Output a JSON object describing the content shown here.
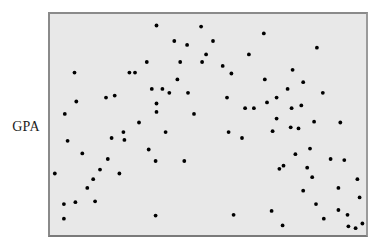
{
  "chart_data": {
    "type": "scatter",
    "title": "",
    "xlabel": "",
    "ylabel": "GPA",
    "xlim": [
      0,
      100
    ],
    "ylim": [
      0,
      100
    ],
    "grid": false,
    "legend": null,
    "x_ticks": [],
    "y_ticks": [],
    "background_color": "#e8e8e8",
    "frame_color": "#8a8a8a",
    "point_color": "#000000",
    "note": "No axis ticks or numeric scale visible; coordinates are relative positions (0-100) within the plot frame. Points form an inverted-U pattern.",
    "series": [
      {
        "name": "students",
        "points": [
          {
            "x": 0.9,
            "y": 27.4
          },
          {
            "x": 3.8,
            "y": 13.3
          },
          {
            "x": 3.8,
            "y": 6.6
          },
          {
            "x": 4.1,
            "y": 54.9
          },
          {
            "x": 5.0,
            "y": 42.5
          },
          {
            "x": 7.2,
            "y": 73.9
          },
          {
            "x": 7.5,
            "y": 14.2
          },
          {
            "x": 7.8,
            "y": 60.6
          },
          {
            "x": 9.7,
            "y": 36.7
          },
          {
            "x": 11.3,
            "y": 20.8
          },
          {
            "x": 13.2,
            "y": 24.8
          },
          {
            "x": 13.8,
            "y": 14.6
          },
          {
            "x": 15.4,
            "y": 29.2
          },
          {
            "x": 17.3,
            "y": 62.4
          },
          {
            "x": 17.9,
            "y": 34.1
          },
          {
            "x": 19.1,
            "y": 43.8
          },
          {
            "x": 20.1,
            "y": 63.3
          },
          {
            "x": 21.6,
            "y": 27.4
          },
          {
            "x": 22.9,
            "y": 46.5
          },
          {
            "x": 23.2,
            "y": 42.9
          },
          {
            "x": 24.8,
            "y": 73.9
          },
          {
            "x": 26.6,
            "y": 73.9
          },
          {
            "x": 27.9,
            "y": 50.9
          },
          {
            "x": 30.4,
            "y": 78.8
          },
          {
            "x": 31.0,
            "y": 38.5
          },
          {
            "x": 32.0,
            "y": 66.4
          },
          {
            "x": 33.5,
            "y": 55.8
          },
          {
            "x": 33.5,
            "y": 59.7
          },
          {
            "x": 33.2,
            "y": 33.2
          },
          {
            "x": 33.2,
            "y": 8.0
          },
          {
            "x": 33.5,
            "y": 95.6
          },
          {
            "x": 35.4,
            "y": 66.4
          },
          {
            "x": 36.4,
            "y": 46.5
          },
          {
            "x": 37.6,
            "y": 64.6
          },
          {
            "x": 39.2,
            "y": 88.5
          },
          {
            "x": 40.2,
            "y": 70.8
          },
          {
            "x": 41.1,
            "y": 78.8
          },
          {
            "x": 42.4,
            "y": 33.2
          },
          {
            "x": 43.3,
            "y": 86.7
          },
          {
            "x": 43.6,
            "y": 64.6
          },
          {
            "x": 45.5,
            "y": 54.9
          },
          {
            "x": 47.8,
            "y": 95.1
          },
          {
            "x": 48.1,
            "y": 78.8
          },
          {
            "x": 49.4,
            "y": 82.3
          },
          {
            "x": 51.6,
            "y": 88.5
          },
          {
            "x": 54.7,
            "y": 77.0
          },
          {
            "x": 56.1,
            "y": 62.4
          },
          {
            "x": 56.6,
            "y": 46.5
          },
          {
            "x": 57.5,
            "y": 73.5
          },
          {
            "x": 61.9,
            "y": 57.5
          },
          {
            "x": 63.1,
            "y": 82.3
          },
          {
            "x": 58.2,
            "y": 8.4
          },
          {
            "x": 60.9,
            "y": 43.8
          },
          {
            "x": 64.7,
            "y": 57.5
          },
          {
            "x": 67.9,
            "y": 92.0
          },
          {
            "x": 68.2,
            "y": 70.8
          },
          {
            "x": 68.9,
            "y": 60.2
          },
          {
            "x": 70.4,
            "y": 10.2
          },
          {
            "x": 70.7,
            "y": 46.9
          },
          {
            "x": 72.0,
            "y": 52.7
          },
          {
            "x": 72.0,
            "y": 62.4
          },
          {
            "x": 72.9,
            "y": 29.6
          },
          {
            "x": 73.9,
            "y": 3.5
          },
          {
            "x": 74.2,
            "y": 31.0
          },
          {
            "x": 75.5,
            "y": 66.4
          },
          {
            "x": 76.5,
            "y": 48.7
          },
          {
            "x": 76.8,
            "y": 57.5
          },
          {
            "x": 77.1,
            "y": 75.2
          },
          {
            "x": 78.0,
            "y": 36.3
          },
          {
            "x": 79.0,
            "y": 48.2
          },
          {
            "x": 79.9,
            "y": 58.8
          },
          {
            "x": 80.5,
            "y": 69.5
          },
          {
            "x": 80.5,
            "y": 19.5
          },
          {
            "x": 81.8,
            "y": 30.1
          },
          {
            "x": 82.7,
            "y": 38.9
          },
          {
            "x": 83.4,
            "y": 25.7
          },
          {
            "x": 84.0,
            "y": 51.3
          },
          {
            "x": 84.6,
            "y": 13.3
          },
          {
            "x": 84.9,
            "y": 85.4
          },
          {
            "x": 86.8,
            "y": 64.6
          },
          {
            "x": 87.1,
            "y": 6.6
          },
          {
            "x": 89.3,
            "y": 34.1
          },
          {
            "x": 91.8,
            "y": 20.8
          },
          {
            "x": 91.8,
            "y": 10.6
          },
          {
            "x": 92.4,
            "y": 50.9
          },
          {
            "x": 93.7,
            "y": 33.6
          },
          {
            "x": 94.7,
            "y": 8.4
          },
          {
            "x": 95.0,
            "y": 3.1
          },
          {
            "x": 97.3,
            "y": 2.2
          },
          {
            "x": 97.9,
            "y": 24.8
          },
          {
            "x": 98.6,
            "y": 16.4
          },
          {
            "x": 99.5,
            "y": 4.4
          }
        ]
      }
    ]
  },
  "labels": {
    "y_axis": "GPA"
  }
}
